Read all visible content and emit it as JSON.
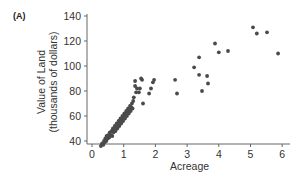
{
  "panel_label": "(A)",
  "chart_data": {
    "type": "scatter",
    "title": "",
    "xlabel": "Acreage",
    "ylabel_line1": "Value of Land",
    "ylabel_line2": "(thousands of dollars)",
    "xlim": [
      0,
      6
    ],
    "ylim": [
      30,
      140
    ],
    "xticks": [
      0,
      1,
      2,
      3,
      4,
      5,
      6
    ],
    "yticks": [
      40,
      60,
      80,
      100,
      120,
      140
    ],
    "grid": false,
    "legend": null,
    "marker_color": "#4a4a4a",
    "points": [
      [
        0.28,
        36
      ],
      [
        0.32,
        38
      ],
      [
        0.36,
        37
      ],
      [
        0.38,
        40
      ],
      [
        0.4,
        39
      ],
      [
        0.42,
        42
      ],
      [
        0.45,
        40
      ],
      [
        0.46,
        44
      ],
      [
        0.5,
        42
      ],
      [
        0.52,
        45
      ],
      [
        0.55,
        43
      ],
      [
        0.56,
        47
      ],
      [
        0.6,
        45
      ],
      [
        0.62,
        48
      ],
      [
        0.64,
        44
      ],
      [
        0.66,
        50
      ],
      [
        0.68,
        47
      ],
      [
        0.7,
        49
      ],
      [
        0.72,
        52
      ],
      [
        0.74,
        48
      ],
      [
        0.76,
        51
      ],
      [
        0.78,
        54
      ],
      [
        0.8,
        50
      ],
      [
        0.82,
        53
      ],
      [
        0.84,
        56
      ],
      [
        0.86,
        52
      ],
      [
        0.88,
        55
      ],
      [
        0.9,
        58
      ],
      [
        0.92,
        54
      ],
      [
        0.94,
        57
      ],
      [
        0.96,
        60
      ],
      [
        0.98,
        56
      ],
      [
        1.0,
        59
      ],
      [
        1.02,
        62
      ],
      [
        1.04,
        58
      ],
      [
        1.06,
        61
      ],
      [
        1.08,
        64
      ],
      [
        1.1,
        60
      ],
      [
        1.12,
        63
      ],
      [
        1.14,
        66
      ],
      [
        1.16,
        62
      ],
      [
        1.18,
        65
      ],
      [
        1.2,
        68
      ],
      [
        1.22,
        64
      ],
      [
        1.24,
        67
      ],
      [
        1.26,
        70
      ],
      [
        1.28,
        66
      ],
      [
        1.3,
        72
      ],
      [
        1.32,
        75
      ],
      [
        1.36,
        84
      ],
      [
        1.36,
        88
      ],
      [
        1.39,
        79
      ],
      [
        1.42,
        82
      ],
      [
        1.48,
        79
      ],
      [
        1.51,
        82
      ],
      [
        1.55,
        90
      ],
      [
        1.58,
        89
      ],
      [
        1.61,
        70
      ],
      [
        1.8,
        78
      ],
      [
        1.86,
        82
      ],
      [
        1.92,
        87
      ],
      [
        1.96,
        89
      ],
      [
        2.62,
        89
      ],
      [
        2.68,
        78
      ],
      [
        3.22,
        99
      ],
      [
        3.38,
        107
      ],
      [
        3.38,
        93
      ],
      [
        3.47,
        80
      ],
      [
        3.63,
        92
      ],
      [
        3.66,
        86
      ],
      [
        3.88,
        118
      ],
      [
        4.0,
        111
      ],
      [
        4.29,
        112
      ],
      [
        5.08,
        131
      ],
      [
        5.2,
        126
      ],
      [
        5.52,
        127
      ],
      [
        5.87,
        110
      ]
    ]
  }
}
